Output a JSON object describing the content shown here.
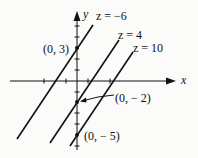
{
  "diagram": {
    "axes": {
      "x_label": "x",
      "y_label": "y"
    },
    "lines": [
      {
        "label": "z = −6",
        "var": "z",
        "value": "−6",
        "y_intercept": 3
      },
      {
        "label": "z = 4",
        "var": "z",
        "value": "4",
        "y_intercept": -2
      },
      {
        "label": "z = 10",
        "var": "z",
        "value": "10",
        "y_intercept": -5
      }
    ],
    "points": [
      {
        "label": "(0, 3)"
      },
      {
        "label": "(0, − 2)"
      },
      {
        "label": "(0, − 5)"
      }
    ]
  }
}
